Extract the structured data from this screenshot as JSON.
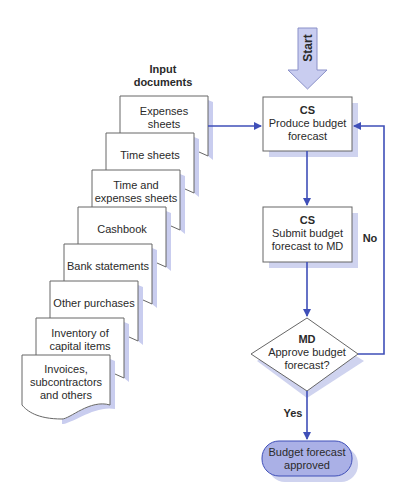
{
  "diagram": {
    "type": "flowchart",
    "colors": {
      "connector": "#3f4fb8",
      "start_arrow_fill": "#c9cdf0",
      "terminal_fill": "#aab0e6",
      "shadow": "#cfd3ef",
      "box_border": "#666666",
      "text": "#2a2a2a"
    },
    "input_documents_title": [
      "Input",
      "documents"
    ],
    "documents": [
      {
        "lines": [
          "Expenses",
          "sheets"
        ]
      },
      {
        "lines": [
          "Time sheets"
        ]
      },
      {
        "lines": [
          "Time and",
          "expenses sheets"
        ]
      },
      {
        "lines": [
          "Cashbook"
        ]
      },
      {
        "lines": [
          "Bank statements"
        ]
      },
      {
        "lines": [
          "Other purchases"
        ]
      },
      {
        "lines": [
          "Inventory of",
          "capital items"
        ]
      },
      {
        "lines": [
          "Invoices,",
          "subcontractors",
          "and others"
        ]
      }
    ],
    "start_label": "Start",
    "nodes": {
      "produce": {
        "role": "CS",
        "text": [
          "Produce budget",
          "forecast"
        ]
      },
      "submit": {
        "role": "CS",
        "text": [
          "Submit budget",
          "forecast to MD"
        ]
      },
      "approve": {
        "role": "MD",
        "text": [
          "Approve budget",
          "forecast?"
        ]
      },
      "end": {
        "text": [
          "Budget forecast",
          "approved"
        ]
      }
    },
    "edge_labels": {
      "no": "No",
      "yes": "Yes"
    }
  }
}
